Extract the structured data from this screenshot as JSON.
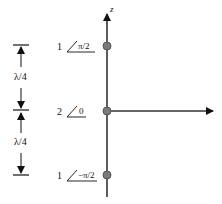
{
  "axis": {
    "vertical_label": "z"
  },
  "elements": [
    {
      "magnitude": "1",
      "phase": "π/2"
    },
    {
      "magnitude": "2",
      "phase": "0"
    },
    {
      "magnitude": "1",
      "phase": "−π/2"
    }
  ],
  "spacing": [
    {
      "label": "λ/4"
    },
    {
      "label": "λ/4"
    }
  ],
  "colors": {
    "line": "#111111",
    "dot_fill": "#7a7a7a",
    "dot_stroke": "#555555"
  }
}
